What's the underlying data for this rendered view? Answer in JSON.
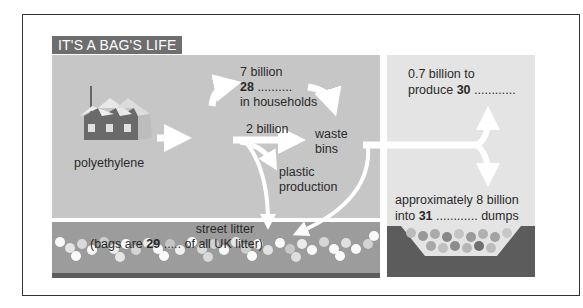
{
  "title": "IT'S A BAG'S LIFE",
  "labels": {
    "source": "polyethylene",
    "households_top": "7 billion",
    "households_num": "28",
    "households_dots": " ..........",
    "households_bottom": "in households",
    "two_billion": "2 billion",
    "waste_bins_1": "waste",
    "waste_bins_2": "bins",
    "plastic_1": "plastic",
    "plastic_2": "production",
    "produce_1": "0.7 billion to",
    "produce_2_pre": "produce ",
    "produce_num": "30",
    "produce_dots": " ............",
    "dumps_1": "approximately 8 billion",
    "dumps_2_pre": "into ",
    "dumps_num": "31",
    "dumps_dots": " ............ dumps",
    "litter_1": "street litter",
    "litter_2_pre": "(bags are ",
    "litter_num": "29",
    "litter_dots": " ..... of all UK litter)"
  },
  "colors": {
    "title_bg": "#6e6e6e",
    "left_panel": "#c6c6c6",
    "right_panel": "#e4e4e4",
    "litter_strip": "#9c9c9c",
    "dump_pit": "#5c5c5c",
    "arrows": "#ffffff"
  },
  "icons": [
    "factory-icon",
    "arrow-icon",
    "dump-pit-icon",
    "litter-bags-icon"
  ]
}
